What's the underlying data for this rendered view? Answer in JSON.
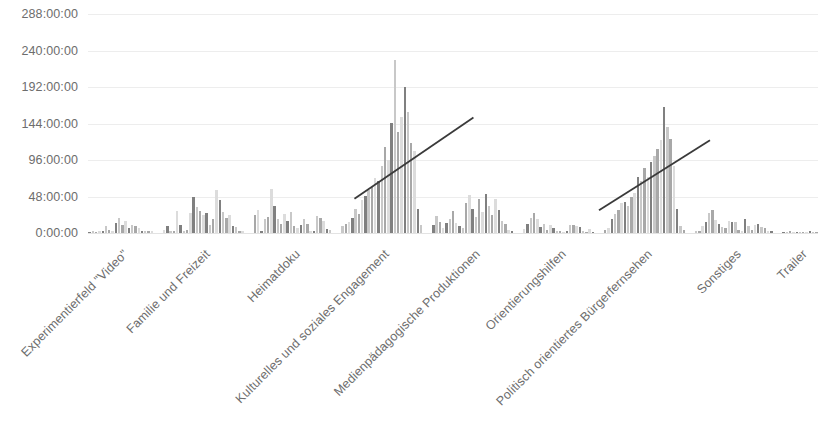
{
  "chart_data": {
    "type": "bar",
    "title": "",
    "subtitle": "",
    "xlabel": "",
    "ylabel": "",
    "grid": true,
    "legend_position": "none",
    "orientation": "vertical",
    "value_unit": "hours",
    "value_format": "H:MM:SS",
    "ylim": [
      0,
      288
    ],
    "yticks": [
      0,
      48,
      96,
      144,
      192,
      240,
      288
    ],
    "ytick_labels": [
      "0:00:00",
      "48:00:00",
      "96:00:00",
      "144:00:00",
      "192:00:00",
      "240:00:00",
      "288:00:00"
    ],
    "categories": [
      "Experimentierfeld \"Video\"",
      "Familie und Freizeit",
      "Heimatdoku",
      "Kulturelles und soziales Engagement",
      "Medienpädagogische Produktionen",
      "Orientierungshilfen",
      "Politisch orientiertes Bürgerfernsehen",
      "Sonstiges",
      "Trailer"
    ],
    "groups": [
      {
        "name": "Experimentierfeld \"Video\"",
        "values": [
          1,
          2,
          1,
          3,
          2,
          9,
          4,
          2,
          13,
          20,
          11,
          16,
          7,
          10,
          9,
          6,
          3,
          3,
          2,
          2
        ]
      },
      {
        "name": "Familie und Freizeit",
        "values": [
          4,
          9,
          3,
          3,
          29,
          10,
          2,
          4,
          26,
          47,
          34,
          29,
          24,
          26,
          10,
          19,
          56,
          43,
          27,
          20,
          24,
          9,
          8,
          3,
          2
        ]
      },
      {
        "name": "Heimatdoku",
        "values": [
          24,
          30,
          2,
          18,
          21,
          58,
          36,
          19,
          12,
          25,
          16,
          28,
          9,
          7,
          11,
          18,
          12,
          3,
          2,
          23,
          20,
          16,
          5,
          4
        ]
      },
      {
        "name": "Kulturelles und soziales Engagement",
        "values": [
          9,
          12,
          14,
          20,
          32,
          25,
          44,
          49,
          57,
          61,
          73,
          69,
          88,
          113,
          96,
          145,
          228,
          133,
          153,
          192,
          159,
          118,
          108,
          31,
          10
        ]
      },
      {
        "name": "Medienpädagogische Produktionen",
        "values": [
          10,
          22,
          15,
          6,
          13,
          18,
          29,
          13,
          9,
          7,
          40,
          50,
          31,
          21,
          45,
          27,
          51,
          35,
          24,
          45,
          30,
          16,
          12,
          4,
          3
        ]
      },
      {
        "name": "Orientierungshilfen",
        "values": [
          5,
          12,
          20,
          26,
          18,
          8,
          12,
          4,
          10,
          6,
          3,
          2,
          1,
          2,
          11,
          10,
          9,
          8,
          2,
          1,
          5,
          1
        ]
      },
      {
        "name": "Politisch orientiertes Bürgerfernsehen",
        "values": [
          4,
          6,
          18,
          25,
          30,
          39,
          41,
          36,
          48,
          52,
          74,
          69,
          86,
          74,
          93,
          101,
          111,
          122,
          166,
          139,
          124,
          88,
          32,
          9,
          4
        ]
      },
      {
        "name": "Sonstiges",
        "values": [
          3,
          2,
          9,
          14,
          26,
          30,
          17,
          12,
          8,
          6,
          16,
          15,
          14,
          4,
          3,
          18,
          9,
          4,
          10,
          12,
          8,
          6,
          3,
          2
        ]
      },
      {
        "name": "Trailer",
        "values": [
          1,
          1,
          2,
          1,
          1,
          1,
          1,
          1,
          2,
          1,
          1
        ]
      }
    ],
    "trendlines": [
      {
        "label": "trendline-kulturelles",
        "over_category": "Kulturelles und soziales Engagement",
        "x_start_frac": 0.365,
        "y_start_value": 45,
        "x_end_frac": 0.528,
        "y_end_value": 152
      },
      {
        "label": "trendline-politisch",
        "over_category": "Politisch orientiertes Bürgerfernsehen",
        "x_start_frac": 0.7,
        "y_start_value": 30,
        "x_end_frac": 0.852,
        "y_end_value": 122
      }
    ],
    "colors": {
      "background": "#ffffff",
      "gridline": "#ededed",
      "baseline": "#e3e3e3",
      "axis_text": "#6d6d6d",
      "bar_dark": "#808080",
      "bar_mid": "#a8a8a8",
      "bar_light": "#c8c8c8",
      "bar_pale": "#dcdcdc",
      "trendline": "#3a3a3a"
    }
  }
}
